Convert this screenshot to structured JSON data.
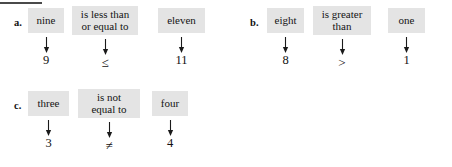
{
  "figure": {
    "title_rule": "",
    "groups": [
      {
        "label": "a.",
        "cells": [
          {
            "phrase": "nine",
            "phrase_line2": "",
            "symbol": "9"
          },
          {
            "phrase": "is less than",
            "phrase_line2": "or equal to",
            "symbol": "≤"
          },
          {
            "phrase": "eleven",
            "phrase_line2": "",
            "symbol": "11"
          }
        ]
      },
      {
        "label": "b.",
        "cells": [
          {
            "phrase": "eight",
            "phrase_line2": "",
            "symbol": "8"
          },
          {
            "phrase": "is greater",
            "phrase_line2": "than",
            "symbol": ">"
          },
          {
            "phrase": "one",
            "phrase_line2": "",
            "symbol": "1"
          }
        ]
      },
      {
        "label": "c.",
        "cells": [
          {
            "phrase": "three",
            "phrase_line2": "",
            "symbol": "3"
          },
          {
            "phrase": "is not",
            "phrase_line2": "equal to",
            "symbol": "≠"
          },
          {
            "phrase": "four",
            "phrase_line2": "",
            "symbol": "4"
          }
        ]
      }
    ],
    "colors": {
      "box_fill": "#e4e4e4",
      "text": "#141414",
      "rule": "#4a4a4a",
      "background": "#ffffff"
    },
    "arrow_icon": "down-arrow-icon"
  }
}
